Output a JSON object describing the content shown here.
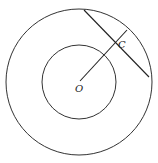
{
  "diagram": {
    "stroke_color": "#222222",
    "background": "#ffffff",
    "labels": {
      "center": "O",
      "point_c": "C"
    },
    "geometry": {
      "center": [
        79,
        82
      ],
      "outer_radius": 73,
      "inner_radius": 37,
      "chord": [
        [
          84,
          10
        ],
        [
          149,
          77
        ]
      ],
      "point_c": [
        116,
        43
      ],
      "radius_line_end": [
        128,
        30
      ]
    }
  }
}
